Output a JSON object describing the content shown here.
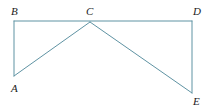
{
  "figure": {
    "background_color": "#ffffff",
    "stroke_color": "#5f93a3",
    "label_color": "#1b1b1b",
    "stroke_width": 1,
    "canvas": {
      "width": 209,
      "height": 110
    },
    "vertices": [
      {
        "id": "A",
        "label": "A",
        "x": 14,
        "y": 76,
        "label_x": 11,
        "label_y": 83
      },
      {
        "id": "B",
        "label": "B",
        "x": 14,
        "y": 21,
        "label_x": 11,
        "label_y": 6
      },
      {
        "id": "C",
        "label": "C",
        "x": 90,
        "y": 22,
        "label_x": 86,
        "label_y": 6
      },
      {
        "id": "D",
        "label": "D",
        "x": 192,
        "y": 21,
        "label_x": 193,
        "label_y": 6
      },
      {
        "id": "E",
        "label": "E",
        "x": 192,
        "y": 93,
        "label_x": 193,
        "label_y": 96
      }
    ],
    "segments": [
      {
        "name": "segment-BD",
        "from": "B",
        "to": "D",
        "points": "14,21 192,21"
      },
      {
        "name": "segment-BA",
        "from": "B",
        "to": "A",
        "points": "14,21 14,76"
      },
      {
        "name": "segment-AC",
        "from": "A",
        "to": "C",
        "points": "14,76 90,22"
      },
      {
        "name": "segment-CE",
        "from": "C",
        "to": "E",
        "points": "90,22 192,93"
      },
      {
        "name": "segment-DE",
        "from": "D",
        "to": "E",
        "points": "192,21 192,93"
      }
    ]
  }
}
